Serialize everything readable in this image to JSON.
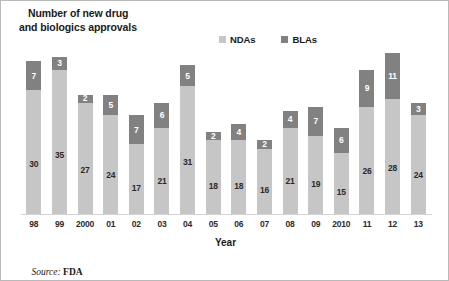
{
  "title": {
    "line1": "Number of new drug",
    "line2": "and biologics approvals"
  },
  "legend": {
    "position": "top-right",
    "entries": [
      {
        "label": "NDAs",
        "color": "#c6c6c6",
        "swatch_name": "ndas-swatch"
      },
      {
        "label": "BLAs",
        "color": "#818181",
        "swatch_name": "blas-swatch"
      }
    ]
  },
  "axis": {
    "x_title": "Year"
  },
  "source": {
    "prefix": "Source: ",
    "value": "FDA"
  },
  "colors": {
    "nda": "#c6c6c6",
    "bla": "#818181",
    "frame": "#b9b9b9",
    "baseline": "#d4d4d4",
    "text": "#1a1a1a"
  },
  "chart_data": {
    "type": "bar",
    "subtype": "stacked",
    "title": "Number of new drug and biologics approvals",
    "xlabel": "Year",
    "ylabel": "",
    "grid": false,
    "legend_position": "top-right",
    "ylim": [
      0,
      39
    ],
    "categories": [
      "98",
      "99",
      "2000",
      "01",
      "02",
      "03",
      "04",
      "05",
      "06",
      "07",
      "08",
      "09",
      "2010",
      "11",
      "12",
      "13"
    ],
    "series": [
      {
        "name": "NDAs",
        "color": "#c6c6c6",
        "values": [
          30,
          35,
          27,
          24,
          17,
          21,
          31,
          18,
          18,
          16,
          21,
          19,
          15,
          26,
          28,
          24
        ]
      },
      {
        "name": "BLAs",
        "color": "#818181",
        "values": [
          7,
          3,
          2,
          5,
          7,
          6,
          5,
          2,
          4,
          2,
          4,
          7,
          6,
          9,
          11,
          3
        ]
      }
    ],
    "totals": [
      37,
      38,
      29,
      29,
      24,
      27,
      36,
      20,
      22,
      18,
      25,
      26,
      21,
      35,
      39,
      27
    ],
    "annotations": [
      "Source: FDA"
    ]
  }
}
